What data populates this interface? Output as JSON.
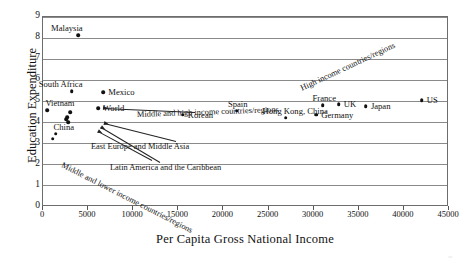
{
  "chart_data": {
    "type": "scatter",
    "title": "",
    "xlabel": "Per Capita Gross National Income",
    "ylabel": "Education Expenditure",
    "xlim": [
      0,
      45000
    ],
    "ylim": [
      0,
      9
    ],
    "xticks": [
      "0",
      "5000",
      "10000",
      "15000",
      "20000",
      "25000",
      "30000",
      "35000",
      "40000",
      "45000"
    ],
    "yticks": [
      "0",
      "1",
      "2",
      "3",
      "4",
      "5",
      "6",
      "7",
      "8",
      "9"
    ],
    "grid": "horizontal",
    "legend": "none",
    "points": [
      {
        "label": "Malaysia",
        "x": 4000,
        "y": 8.1,
        "label_dx": -27,
        "label_dy": -11
      },
      {
        "label": "South Africa",
        "x": 3300,
        "y": 5.45,
        "label_dx": -33,
        "label_dy": -11
      },
      {
        "label": "Mexico",
        "x": 6800,
        "y": 5.38,
        "label_dx": 5,
        "label_dy": -4
      },
      {
        "label": "Vietnam",
        "x": 600,
        "y": 4.55,
        "label_dx": -2,
        "label_dy": -11
      },
      {
        "label": "World",
        "x": 6200,
        "y": 4.62,
        "label_dx": 5,
        "label_dy": -4
      },
      {
        "label": "Korean",
        "x": 15600,
        "y": 4.32,
        "label_dx": 5,
        "label_dy": -4
      },
      {
        "label": "Spain",
        "x": 21600,
        "y": 4.52,
        "label_dx": -9,
        "label_dy": -11
      },
      {
        "label": "Hong Kong, China",
        "x": 27000,
        "y": 4.18,
        "label_dx": -23,
        "label_dy": -11
      },
      {
        "label": "Germany",
        "x": 30400,
        "y": 4.32,
        "label_dx": 5,
        "label_dy": -4
      },
      {
        "label": "France",
        "x": 31100,
        "y": 4.78,
        "label_dx": -10,
        "label_dy": -11
      },
      {
        "label": "UK",
        "x": 32900,
        "y": 4.82,
        "label_dx": 5,
        "label_dy": -4
      },
      {
        "label": "Japan",
        "x": 35900,
        "y": 4.72,
        "label_dx": 5,
        "label_dy": -4
      },
      {
        "label": "US",
        "x": 42100,
        "y": 5.0,
        "label_dx": 5,
        "label_dy": -4
      },
      {
        "label": "China",
        "x": 1500,
        "y": 3.42,
        "label_dx": -2,
        "label_dy": -11
      },
      {
        "label": "",
        "x": 1200,
        "y": 3.18,
        "label_dx": 0,
        "label_dy": 0
      },
      {
        "label": "",
        "x": 3100,
        "y": 4.45,
        "label_dx": 0,
        "label_dy": 0
      },
      {
        "label": "",
        "x": 2700,
        "y": 4.12,
        "label_dx": 0,
        "label_dy": 0
      },
      {
        "label": "",
        "x": 2900,
        "y": 3.98,
        "label_dx": 0,
        "label_dy": 0
      },
      {
        "label": "",
        "x": 2800,
        "y": 4.22,
        "label_dx": 0,
        "label_dy": 0
      }
    ],
    "group_annotations": [
      {
        "text": "High income countries/regions",
        "rotation": -25,
        "x_px": 301,
        "y_px": 84
      },
      {
        "text": "Middle and high income countries/regions",
        "rotation": -2,
        "x_px": 137,
        "y_px": 110
      },
      {
        "text": "East Europe and Middle Asia",
        "rotation": 0,
        "x_px": 91,
        "y_px": 142
      },
      {
        "text": "Latin America and the Caribbean",
        "rotation": 0,
        "x_px": 110,
        "y_px": 163
      },
      {
        "text": "Middle and lower income countries/regions",
        "rotation": 27,
        "x_px": 62,
        "y_px": 160
      }
    ]
  }
}
